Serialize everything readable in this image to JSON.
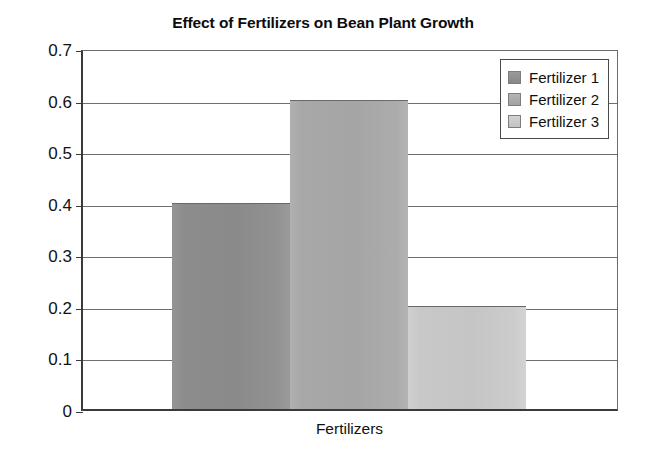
{
  "chart_data": {
    "type": "bar",
    "title": "Effect of Fertilizers on Bean Plant Growth",
    "xlabel": "Fertilizers",
    "ylabel": "",
    "categories": [
      "Fertilizer 1",
      "Fertilizer 2",
      "Fertilizer 3"
    ],
    "values": [
      0.4,
      0.6,
      0.2
    ],
    "ylim": [
      0,
      0.7
    ],
    "ytick_values": [
      0.7,
      0.6,
      0.5,
      0.4,
      0.3,
      0.2,
      0.1,
      0
    ],
    "ytick_labels": [
      "0.7",
      "0.6",
      "0.5",
      "0.4",
      "0.3",
      "0.2",
      "0.1",
      "0"
    ],
    "grid": "horizontal",
    "legend_position": "top-right-inside",
    "bar_gap": "none",
    "colors": [
      "#8c8c8c",
      "#a8a8a8",
      "#c8c8c8"
    ],
    "series": [
      {
        "name": "Fertilizer 1",
        "value": 0.4,
        "color": "#8c8c8c"
      },
      {
        "name": "Fertilizer 2",
        "value": 0.6,
        "color": "#a8a8a8"
      },
      {
        "name": "Fertilizer 3",
        "value": 0.2,
        "color": "#c8c8c8"
      }
    ]
  },
  "legend": {
    "items": [
      {
        "label": "Fertilizer 1"
      },
      {
        "label": "Fertilizer 2"
      },
      {
        "label": "Fertilizer 3"
      }
    ]
  }
}
